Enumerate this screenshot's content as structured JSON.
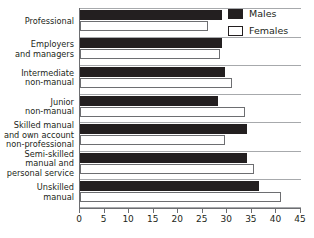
{
  "chart_data": {
    "type": "bar",
    "orientation": "horizontal",
    "title": "",
    "xlabel": "",
    "ylabel": "",
    "xlim": [
      0,
      45
    ],
    "xticks": [
      0,
      5,
      10,
      15,
      20,
      25,
      30,
      35,
      40,
      45
    ],
    "grid": true,
    "legend_position": "top-right",
    "categories": [
      "Professional",
      "Employers and managers",
      "Intermediate non-manual",
      "Junior non-manual",
      "Skilled manual and own account non-professional",
      "Semi-skilled manual and personal service",
      "Unskilled manual"
    ],
    "category_lines": [
      [
        "Professional"
      ],
      [
        "Employers",
        "and managers"
      ],
      [
        "Intermediate",
        "non-manual"
      ],
      [
        "Junior",
        "non-manual"
      ],
      [
        "Skilled manual",
        "and own account",
        "non-professional"
      ],
      [
        "Semi-skilled",
        "manual and",
        "personal service"
      ],
      [
        "Unskilled",
        "manual"
      ]
    ],
    "series": [
      {
        "name": "Males",
        "color": "#231f20",
        "values": [
          29,
          29,
          29.5,
          28,
          34,
          34,
          36.5
        ]
      },
      {
        "name": "Females",
        "color": "#ffffff",
        "values": [
          26,
          28.5,
          31,
          33.5,
          29.5,
          35.5,
          41
        ]
      }
    ]
  },
  "legend": {
    "items": [
      {
        "label": "Males",
        "swatch": "filled-square-icon"
      },
      {
        "label": "Females",
        "swatch": "hollow-square-icon"
      }
    ]
  },
  "axis": {
    "tick_labels": [
      "0",
      "5",
      "10",
      "15",
      "20",
      "25",
      "30",
      "35",
      "40",
      "45"
    ]
  }
}
